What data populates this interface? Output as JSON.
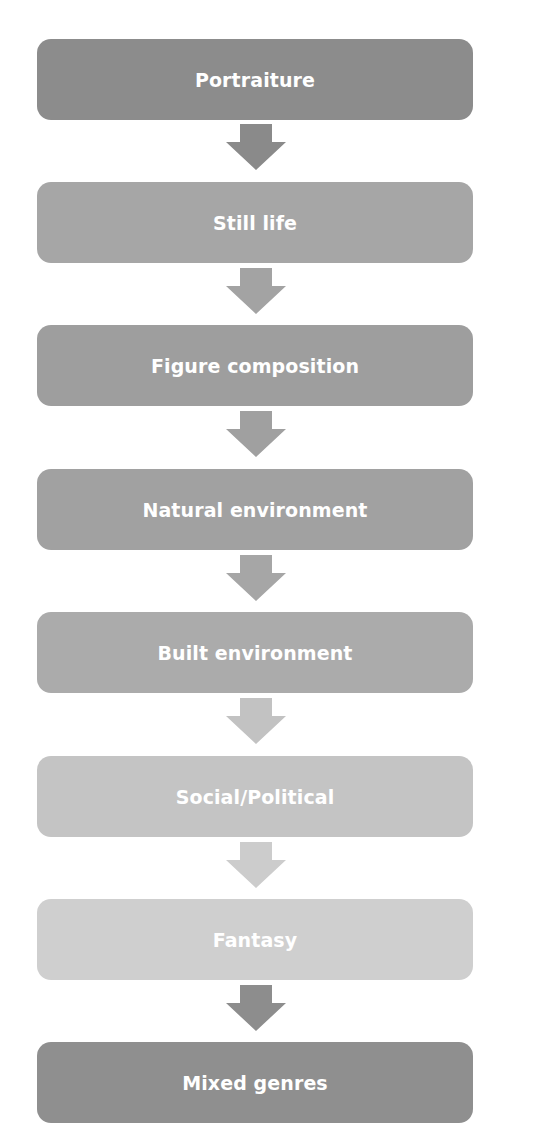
{
  "diagram": {
    "type": "flowchart",
    "direction": "top-to-bottom",
    "steps": [
      {
        "label": "Portraiture",
        "color": "#8c8c8c"
      },
      {
        "label": "Still life",
        "color": "#a6a6a6"
      },
      {
        "label": "Figure composition",
        "color": "#9e9e9e"
      },
      {
        "label": "Natural environment",
        "color": "#a1a1a1"
      },
      {
        "label": "Built environment",
        "color": "#ababab"
      },
      {
        "label": "Social/Political",
        "color": "#c4c4c4"
      },
      {
        "label": "Fantasy",
        "color": "#cfcfcf"
      },
      {
        "label": "Mixed genres",
        "color": "#8f8f8f"
      }
    ],
    "arrows": [
      {
        "from": "Portraiture",
        "to": "Still life",
        "color": "#8a8a8a"
      },
      {
        "from": "Still life",
        "to": "Figure composition",
        "color": "#a3a3a3"
      },
      {
        "from": "Figure composition",
        "to": "Natural environment",
        "color": "#a0a0a0"
      },
      {
        "from": "Natural environment",
        "to": "Built environment",
        "color": "#a6a6a6"
      },
      {
        "from": "Built environment",
        "to": "Social/Political",
        "color": "#c2c2c2"
      },
      {
        "from": "Social/Political",
        "to": "Fantasy",
        "color": "#cccccc"
      },
      {
        "from": "Fantasy",
        "to": "Mixed genres",
        "color": "#8d8d8d"
      }
    ]
  }
}
